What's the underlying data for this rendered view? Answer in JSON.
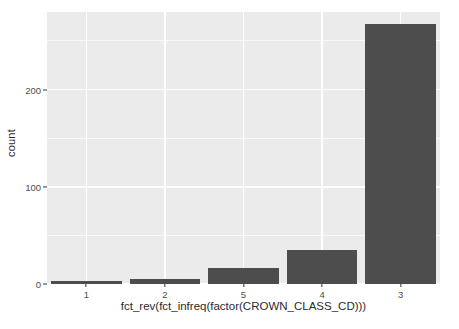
{
  "chart_data": {
    "type": "bar",
    "title": "",
    "subtitle": "",
    "xlabel": "fct_rev(fct_infreq(factor(CROWN_CLASS_CD)))",
    "ylabel": "count",
    "categories": [
      "1",
      "2",
      "5",
      "4",
      "3"
    ],
    "values": [
      3,
      5,
      16,
      35,
      268
    ],
    "series": [
      {
        "name": "count",
        "values": [
          3,
          5,
          16,
          35,
          268
        ]
      }
    ],
    "ylim": [
      0,
      280
    ],
    "y_ticks": [
      0,
      100,
      200
    ],
    "y_tick_labels": [
      "0",
      "100",
      "200"
    ],
    "y_minor_ticks": [
      50,
      150,
      250
    ],
    "grid": true,
    "legend": "none",
    "bar_color": "#4d4d4d",
    "panel_background": "#ebebeb",
    "grid_color": "#ffffff",
    "axis_text_color": "#4d4d4d",
    "axis_title_color": "#2b2b2b",
    "plot_background": "#ffffff"
  }
}
